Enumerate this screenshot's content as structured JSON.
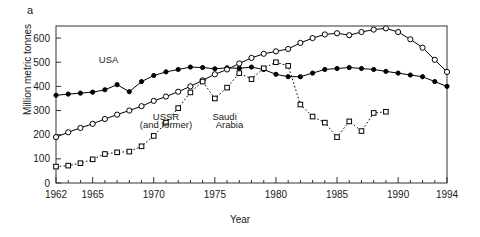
{
  "panel": {
    "label": "a"
  },
  "chart_data": {
    "type": "line",
    "title": "",
    "xlabel": "Year",
    "ylabel": "Million metric tonnes",
    "xlim": [
      1962,
      1994
    ],
    "ylim": [
      0,
      650
    ],
    "grid": false,
    "legend": "inline-annotations",
    "ytick_labels": [
      "0",
      "100",
      "200",
      "300",
      "400",
      "500",
      "600"
    ],
    "ytick_values": [
      0,
      100,
      200,
      300,
      400,
      500,
      600
    ],
    "xtick_labels": [
      "1962",
      "1965",
      "1970",
      "1975",
      "1980",
      "1985",
      "1990",
      "1994"
    ],
    "xtick_values": [
      1962,
      1965,
      1970,
      1975,
      1980,
      1985,
      1990,
      1994
    ],
    "x": [
      1962,
      1963,
      1964,
      1965,
      1966,
      1967,
      1968,
      1969,
      1970,
      1971,
      1972,
      1973,
      1974,
      1975,
      1976,
      1977,
      1978,
      1979,
      1980,
      1981,
      1982,
      1983,
      1984,
      1985,
      1986,
      1987,
      1988,
      1989,
      1990,
      1991,
      1992,
      1993,
      1994
    ],
    "series": [
      {
        "name": "USA",
        "marker": "filled-circle",
        "line": "solid",
        "values": [
          363,
          368,
          372,
          376,
          386,
          407,
          378,
          420,
          445,
          460,
          470,
          480,
          478,
          473,
          477,
          475,
          480,
          470,
          450,
          440,
          440,
          455,
          470,
          474,
          478,
          474,
          470,
          462,
          455,
          447,
          440,
          420,
          400
        ]
      },
      {
        "name": "USSR (and former)",
        "marker": "open-circle",
        "line": "solid",
        "values": [
          190,
          210,
          228,
          245,
          265,
          283,
          300,
          318,
          340,
          358,
          378,
          400,
          425,
          450,
          470,
          495,
          518,
          535,
          545,
          555,
          580,
          600,
          615,
          620,
          612,
          625,
          635,
          640,
          625,
          595,
          560,
          510,
          460
        ]
      },
      {
        "name": "Saudi Arabia",
        "marker": "open-square",
        "line": "dotted",
        "values": [
          68,
          72,
          82,
          98,
          120,
          127,
          130,
          152,
          195,
          250,
          310,
          375,
          420,
          350,
          395,
          455,
          430,
          475,
          500,
          485,
          325,
          275,
          250,
          190,
          255,
          215,
          290,
          295,
          null,
          null,
          null,
          null,
          null
        ]
      }
    ],
    "annotations": [
      {
        "text": "USA",
        "x": 1966.3,
        "y": 498
      },
      {
        "text": "USSR",
        "x": 1971.0,
        "y": 262
      },
      {
        "text": "(and former)",
        "x": 1971.0,
        "y": 228
      },
      {
        "text": "Saudi",
        "x": 1975.8,
        "y": 262
      },
      {
        "text": "Arabia",
        "x": 1976.2,
        "y": 228
      }
    ]
  }
}
